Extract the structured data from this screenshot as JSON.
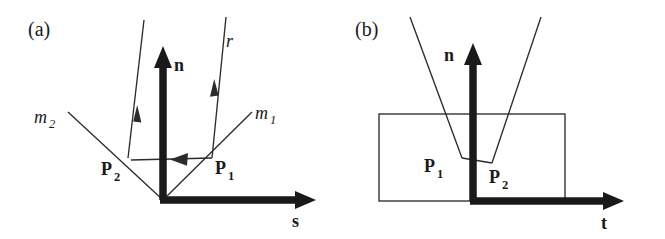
{
  "figure": {
    "background_color": "#ffffff",
    "ink_color": "#1a1a1a",
    "thin_line_color": "#2b2b2b",
    "panels": [
      {
        "tag": "(a)",
        "tag_x": 28,
        "tag_y": 36,
        "description": "Ray r striking surface at P1, reflecting toward P2 along surface, then leaving upward; axes n (normal) and s (surface tangent).",
        "origin": {
          "x": 163,
          "y": 200
        },
        "axes": [
          {
            "name": "normal-axis",
            "label": "n",
            "label_x": 174,
            "label_y": 71,
            "x1": 163,
            "y1": 200,
            "x2": 163,
            "y2": 58,
            "tip_x": 163,
            "tip_y": 47
          },
          {
            "name": "tangent-axis",
            "label": "s",
            "label_x": 292,
            "label_y": 227,
            "x1": 163,
            "y1": 200,
            "x2": 302,
            "y2": 200,
            "tip_x": 315,
            "tip_y": 200
          }
        ],
        "points": [
          {
            "label": "P",
            "sub": "2",
            "px": 128,
            "py": 158,
            "label_x": 101,
            "label_y": 175
          },
          {
            "label": "P",
            "sub": "1",
            "px": 212,
            "py": 158,
            "label_x": 215,
            "label_y": 174
          }
        ],
        "rays": [
          {
            "name": "incident-ray-r",
            "label": "r",
            "sub": "",
            "label_x": 226,
            "label_y": 47,
            "x1": 226,
            "y1": 17,
            "x2": 212,
            "y2": 158,
            "arrow_t": 0.5
          },
          {
            "name": "exit-ray-m2",
            "label": "m",
            "sub": "2",
            "label_x": 34,
            "label_y": 123,
            "x1": 144,
            "y1": 20,
            "x2": 128,
            "y2": 158,
            "arrow_t": 0.76
          }
        ],
        "micro_facets": [
          {
            "name": "microfacet-m1",
            "label": "m",
            "sub": "1",
            "label_x": 255,
            "label_y": 119,
            "x1": 252,
            "y1": 112,
            "x2": 163,
            "y2": 200
          },
          {
            "name": "microfacet-m2",
            "label": "m",
            "sub": "2",
            "label_x": 34,
            "label_y": 123,
            "x1": 68,
            "y1": 112,
            "x2": 163,
            "y2": 200
          }
        ],
        "transfer_segment": {
          "name": "p1-to-p2-transfer",
          "x1": 212,
          "y1": 158,
          "x2": 128,
          "y2": 160,
          "arrow_at": "p2"
        }
      },
      {
        "tag": "(b)",
        "tag_x": 355,
        "tag_y": 36,
        "description": "Ray entering a rectangular groove/cavity, hitting P1 then P2 and exiting; axes n (normal) and t (tangent).",
        "origin": {
          "x": 473,
          "y": 201
        },
        "rectangle": {
          "name": "groove-rectangle",
          "x": 379,
          "y": 114,
          "width": 186,
          "height": 87
        },
        "axes": [
          {
            "name": "normal-axis",
            "label": "n",
            "label_x": 448,
            "label_y": 61,
            "x1": 473,
            "y1": 201,
            "x2": 473,
            "y2": 56,
            "tip_x": 473,
            "tip_y": 44
          },
          {
            "name": "tangent-axis",
            "label": "t",
            "label_x": 601,
            "label_y": 229,
            "x1": 473,
            "y1": 201,
            "x2": 610,
            "y2": 201,
            "tip_x": 623,
            "tip_y": 201
          }
        ],
        "points": [
          {
            "label": "P",
            "sub": "1",
            "px": 462,
            "py": 158,
            "label_x": 424,
            "label_y": 172
          },
          {
            "label": "P",
            "sub": "2",
            "px": 492,
            "py": 163,
            "label_x": 489,
            "label_y": 183
          }
        ],
        "rays": [
          {
            "name": "incident-ray-left",
            "x1": 410,
            "y1": 17,
            "x2": 462,
            "y2": 158
          },
          {
            "name": "exit-ray-right",
            "x1": 541,
            "y1": 17,
            "x2": 492,
            "y2": 163
          }
        ],
        "transfer_segment": {
          "name": "p1-to-p2-transfer",
          "x1": 462,
          "y1": 158,
          "x2": 492,
          "y2": 163
        }
      }
    ]
  }
}
